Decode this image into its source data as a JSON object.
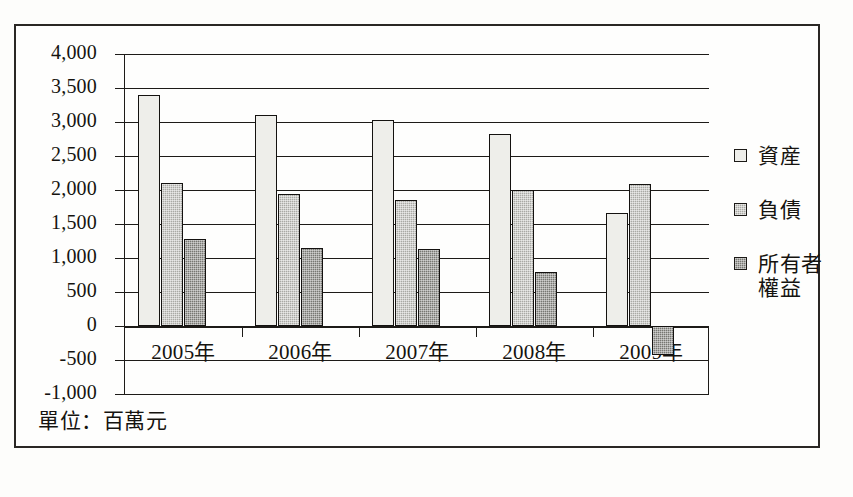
{
  "chart_data": {
    "type": "bar",
    "title": "",
    "subtitle": "",
    "xlabel": "",
    "ylabel": "",
    "unit_note": "單位：百萬元",
    "categories": [
      "2005年",
      "2006年",
      "2007年",
      "2008年",
      "2009年"
    ],
    "series": [
      {
        "name": "資産",
        "values": [
          3390,
          3105,
          3030,
          2830,
          1660
        ],
        "color": "#eeeeea"
      },
      {
        "name": "負債",
        "values": [
          2105,
          1945,
          1860,
          1995,
          2090
        ],
        "color": "#a9a9a4"
      },
      {
        "name": "所有者權益",
        "values": [
          1275,
          1140,
          1130,
          800,
          -430
        ],
        "color": "#777772"
      }
    ],
    "ylim": [
      -1000,
      4000
    ],
    "ytick_step": 500,
    "ytick_labels": [
      "4,000",
      "3,500",
      "3,000",
      "2,500",
      "2,000",
      "1,500",
      "1,000",
      "500",
      "0",
      "-500",
      "-1,000"
    ],
    "ytick_values": [
      4000,
      3500,
      3000,
      2500,
      2000,
      1500,
      1000,
      500,
      0,
      -500,
      -1000
    ],
    "grid": true,
    "legend_position": "right",
    "legend_entries": [
      "資産",
      "負債",
      "所有者權益"
    ]
  },
  "legend": {
    "items": [
      {
        "label": "資産"
      },
      {
        "label": "負債"
      },
      {
        "label_line1": "所有者",
        "label_line2": "權益"
      }
    ]
  },
  "caption": {
    "text": "單位：百萬元"
  }
}
